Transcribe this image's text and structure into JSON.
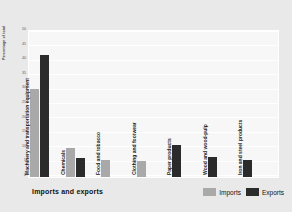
{
  "chart_data": {
    "type": "bar",
    "title": "Imports and exports",
    "xlabel": "",
    "ylabel": "Percentage of total",
    "ylim": [
      0,
      50
    ],
    "grid": true,
    "legend_position": "bottom-right",
    "yticks": [
      "50",
      "45",
      "40",
      "35",
      "30",
      "25",
      "20",
      "15",
      "10",
      "5",
      "0"
    ],
    "categories": [
      "Machinery and transportation equipment",
      "Chemicals",
      "Food and tobacco",
      "Clothing and footwear",
      "Paper products",
      "Wood and wood-pulp",
      "Iron and steel products"
    ],
    "series": [
      {
        "name": "Imports",
        "color": "#a9a9a9",
        "values": [
          30.5,
          10.0,
          6.0,
          5.5,
          null,
          null,
          null
        ]
      },
      {
        "name": "Exports",
        "color": "#2b2b2b",
        "values": [
          42.5,
          6.5,
          null,
          null,
          11.0,
          7.0,
          6.0
        ]
      }
    ]
  },
  "legend": {
    "imports_label": "Imports",
    "exports_label": "Exports"
  },
  "colors": {
    "imports": "#a9a9a9",
    "exports": "#2b2b2b",
    "background": "#e9e9e9",
    "plot_background": "#f7f7f7"
  }
}
